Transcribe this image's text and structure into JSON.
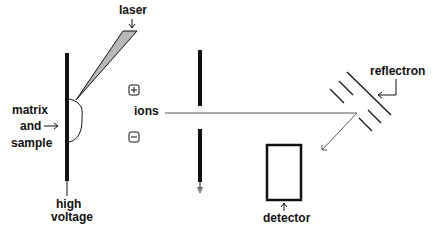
{
  "labels": {
    "laser": "laser",
    "matrix": "matrix",
    "and": "and",
    "sample": "sample",
    "high": "high",
    "voltage": "voltage",
    "ions": "ions",
    "reflectron": "reflectron",
    "detector": "detector",
    "plus": "+",
    "minus": "−"
  },
  "colors": {
    "stroke": "#111111",
    "beam_fill": "#b8b8b8",
    "ion_path": "#555555"
  }
}
